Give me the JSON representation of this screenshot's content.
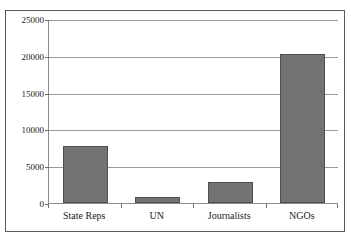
{
  "chart_data": {
    "type": "bar",
    "title": "",
    "subtitle": "",
    "xlabel": "",
    "ylabel": "",
    "categories": [
      "State Reps",
      "UN",
      "Journalists",
      "NGOs"
    ],
    "values": [
      7800,
      800,
      2900,
      20300
    ],
    "series": [
      {
        "name": "",
        "values": [
          7800,
          800,
          2900,
          20300
        ]
      }
    ],
    "ylim": [
      0,
      25000
    ],
    "ytick_labels": [
      "0",
      "5000",
      "10000",
      "15000",
      "20000",
      "25000"
    ],
    "ytick_values": [
      0,
      5000,
      10000,
      15000,
      20000,
      25000
    ],
    "grid": true,
    "grid_axis": "y",
    "legend": false,
    "legend_position": "none",
    "annotations": [],
    "bar_color": "#737373",
    "bar_edge_color": "#4f4f4f",
    "axis_color": "#8c8c8c",
    "grid_color": "#9a9a9a",
    "frame_color": "#5a5a5a",
    "background_color": "#ffffff",
    "text_color": "#1a1a1a"
  }
}
